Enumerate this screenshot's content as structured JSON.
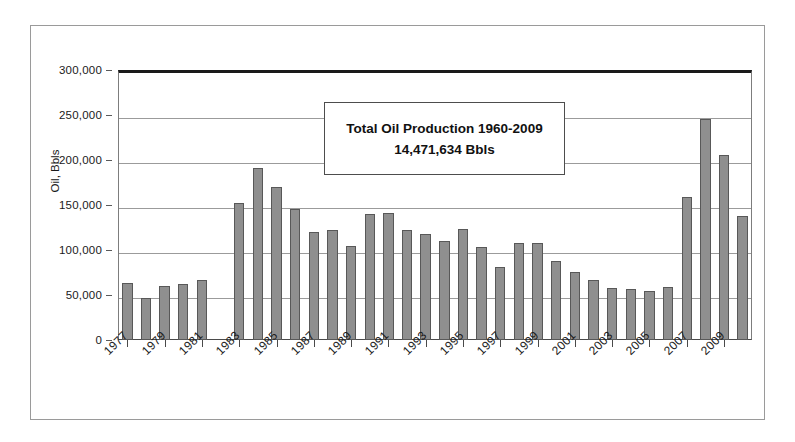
{
  "chart_data": {
    "type": "bar",
    "title": "",
    "xlabel": "",
    "ylabel": "Oil, Bbls",
    "ylim": [
      0,
      300000
    ],
    "yticks": [
      0,
      50000,
      100000,
      150000,
      200000,
      250000,
      300000
    ],
    "ytick_labels": [
      "0",
      "50,000",
      "100,000",
      "150,000",
      "200,000",
      "250,000",
      "300,000"
    ],
    "grid": true,
    "legend": false,
    "categories": [
      "1977",
      "1978",
      "1979",
      "1980",
      "1981",
      "1982",
      "1983",
      "1984",
      "1985",
      "1986",
      "1987",
      "1988",
      "1989",
      "1990",
      "1991",
      "1992",
      "1993",
      "1994",
      "1995",
      "1996",
      "1997",
      "1998",
      "1999",
      "2000",
      "2001",
      "2002",
      "2003",
      "2004",
      "2005",
      "2006",
      "2007",
      "2008",
      "2009",
      "2010"
    ],
    "values": [
      63000,
      47000,
      60000,
      62000,
      67000,
      0,
      152000,
      191000,
      170000,
      146000,
      120000,
      122000,
      104000,
      140000,
      141000,
      122000,
      118000,
      110000,
      123000,
      103000,
      81000,
      108000,
      108000,
      88000,
      76000,
      67000,
      58000,
      57000,
      55000,
      59000,
      159000,
      246000,
      206000,
      138000
    ],
    "xtick_labels": [
      "1977",
      "1979",
      "1981",
      "1983",
      "1985",
      "1987",
      "1989",
      "1991",
      "1993",
      "1995",
      "1997",
      "1999",
      "2001",
      "2003",
      "2005",
      "2007",
      "2009"
    ],
    "bar_color": "#8f8f8f",
    "bar_edge_color": "#585858",
    "gridline_color": "#9b9b9b"
  },
  "annotation": {
    "line1": "Total Oil Production 1960-2009",
    "line2": "14,471,634 Bbls"
  }
}
